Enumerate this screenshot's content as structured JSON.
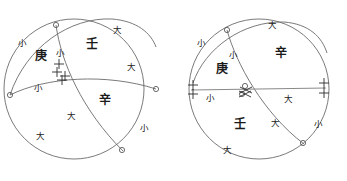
{
  "figure": {
    "type": "geometric-diagram",
    "panel_count": 2,
    "stroke_color": "#6b6b6b",
    "text_color": "#1a1a1a"
  },
  "panels": [
    {
      "id": "left-panel",
      "name": "left-circle-diagram",
      "center": {
        "x": 74,
        "y": 89
      },
      "radius": 70,
      "stem_labels": [
        {
          "text": "壬",
          "x": 92,
          "y": 44,
          "size": "big",
          "name": "label-ren"
        },
        {
          "text": "庚",
          "x": 41,
          "y": 56,
          "size": "big",
          "name": "label-geng"
        },
        {
          "text": "辛",
          "x": 105,
          "y": 100,
          "size": "big",
          "name": "label-xin"
        }
      ],
      "magnitude_labels": [
        {
          "text": "大",
          "x": 117,
          "y": 30,
          "size": "small",
          "name": "mark-da-1"
        },
        {
          "text": "大",
          "x": 131,
          "y": 67,
          "size": "small",
          "name": "mark-da-2"
        },
        {
          "text": "小",
          "x": 22,
          "y": 43,
          "size": "small",
          "name": "mark-xiao-1"
        },
        {
          "text": "小",
          "x": 60,
          "y": 53,
          "size": "small",
          "name": "mark-xiao-2"
        },
        {
          "text": "小",
          "x": 38,
          "y": 88,
          "size": "small",
          "name": "mark-xiao-3"
        },
        {
          "text": "大",
          "x": 71,
          "y": 116,
          "size": "small",
          "name": "mark-da-3"
        },
        {
          "text": "大",
          "x": 40,
          "y": 136,
          "size": "small",
          "name": "mark-da-4"
        },
        {
          "text": "小",
          "x": 144,
          "y": 128,
          "size": "small",
          "name": "mark-xiao-4"
        }
      ],
      "node_markers": [
        {
          "x": 56,
          "y": 25,
          "r": 2.6,
          "name": "node-top"
        },
        {
          "x": 10,
          "y": 95,
          "r": 2.6,
          "name": "node-left"
        },
        {
          "x": 156,
          "y": 89,
          "r": 2.6,
          "name": "node-right"
        },
        {
          "x": 122,
          "y": 150,
          "r": 2.6,
          "name": "node-bottom"
        }
      ],
      "tick_cluster": {
        "x": 60,
        "y": 73,
        "count": 4,
        "name": "intersection-ticks"
      },
      "arcs": [
        {
          "name": "arc-upper",
          "d": "M 10,95 C 26,47 70,17 112,19 C 137,20 152,32 156,46"
        },
        {
          "name": "arc-equator",
          "d": "M 10,95 C 45,78 105,74 156,89"
        },
        {
          "name": "arc-meridian",
          "d": "M 56,25 C 62,60 82,108 122,150"
        }
      ]
    },
    {
      "id": "right-panel",
      "name": "right-circle-diagram",
      "center": {
        "x": 259,
        "y": 89
      },
      "radius": 70,
      "stem_labels": [
        {
          "text": "辛",
          "x": 281,
          "y": 53,
          "size": "big",
          "name": "label-xin"
        },
        {
          "text": "庚",
          "x": 222,
          "y": 69,
          "size": "big",
          "name": "label-geng"
        },
        {
          "text": "壬",
          "x": 240,
          "y": 124,
          "size": "big",
          "name": "label-ren"
        }
      ],
      "magnitude_labels": [
        {
          "text": "大",
          "x": 272,
          "y": 25,
          "size": "small",
          "name": "mark-da-1"
        },
        {
          "text": "小",
          "x": 201,
          "y": 43,
          "size": "small",
          "name": "mark-xiao-1"
        },
        {
          "text": "小",
          "x": 233,
          "y": 55,
          "size": "small",
          "name": "mark-xiao-2"
        },
        {
          "text": "小",
          "x": 210,
          "y": 98,
          "size": "small",
          "name": "mark-xiao-3"
        },
        {
          "text": "大",
          "x": 288,
          "y": 99,
          "size": "small",
          "name": "mark-da-2"
        },
        {
          "text": "大",
          "x": 275,
          "y": 123,
          "size": "small",
          "name": "mark-da-3"
        },
        {
          "text": "小",
          "x": 318,
          "y": 124,
          "size": "small",
          "name": "mark-xiao-4"
        },
        {
          "text": "大",
          "x": 227,
          "y": 150,
          "size": "small",
          "name": "mark-da-4"
        }
      ],
      "node_markers": [
        {
          "x": 227,
          "y": 30,
          "r": 2.6,
          "name": "node-top"
        },
        {
          "x": 245,
          "y": 86,
          "r": 2.6,
          "name": "node-center-upper"
        },
        {
          "x": 242,
          "y": 94,
          "r": 2.6,
          "name": "node-center-lower"
        },
        {
          "x": 303,
          "y": 143,
          "r": 2.6,
          "name": "node-bottom-right"
        }
      ],
      "end_ticks": [
        {
          "x": 192,
          "y": 90,
          "name": "tick-left-end"
        },
        {
          "x": 324,
          "y": 88,
          "name": "tick-right-end"
        }
      ],
      "center_ticks": {
        "x": 247,
        "y": 90,
        "name": "intersection-ticks"
      },
      "arcs": [
        {
          "name": "arc-upper",
          "d": "M 193,83 C 205,48 242,21 283,22 C 308,23 322,36 327,52"
        },
        {
          "name": "arc-meridian",
          "d": "M 227,30 C 236,62 262,112 303,143"
        }
      ],
      "horizontal_line": {
        "x1": 191,
        "y1": 90,
        "x2": 326,
        "y2": 88,
        "name": "equator-line"
      }
    }
  ]
}
